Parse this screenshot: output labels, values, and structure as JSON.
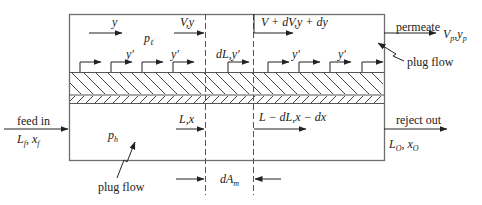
{
  "diagram": {
    "type": "membrane-separator-crossflow-plug-flow",
    "colors": {
      "line": "#6e6e6e",
      "text": "#222222",
      "background": "#ffffff"
    },
    "permeate_side": {
      "pressure_label": "p",
      "pressure_sub": "ℓ",
      "flow_in_label": "y",
      "flow_element_in": "V,y",
      "flow_element_out": "V + dV,y + dy",
      "local_permeate_labels": [
        "y′",
        "y′",
        "dL,y′",
        "y′",
        "y′"
      ],
      "outlet_label": "permeate",
      "outlet_value": "V",
      "outlet_value_sub": "p",
      "outlet_value2": "y",
      "outlet_value2_sub": "p",
      "flow_regime_label": "plug flow"
    },
    "feed_side": {
      "pressure_label": "p",
      "pressure_sub": "h",
      "inlet_label": "feed in",
      "inlet_L": "L",
      "inlet_L_sub": "f",
      "inlet_x": "x",
      "inlet_x_sub": "f",
      "flow_element_in": "L,x",
      "flow_element_out": "L − dL,x − dx",
      "outlet_label": "reject out",
      "outlet_L": "L",
      "outlet_L_sub": "O",
      "outlet_x": "x",
      "outlet_x_sub": "O",
      "flow_regime_label": "plug flow"
    },
    "element": {
      "area_label": "dA",
      "area_sub": "m"
    }
  }
}
